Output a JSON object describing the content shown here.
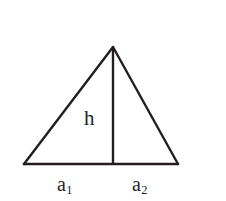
{
  "figure": {
    "kind": "geometry-diagram",
    "shape": "triangle",
    "background_color": "#ffffff",
    "stroke_color": "#231f1f",
    "labels": {
      "height": "h",
      "base_left": "a",
      "base_left_subscript": "1",
      "base_right": "a",
      "base_right_subscript": "2"
    },
    "geometry": {
      "apex": [
        113,
        47
      ],
      "left_vertex": [
        24,
        164
      ],
      "right_vertex": [
        178,
        164
      ],
      "foot_of_height": [
        113,
        164
      ],
      "base_stroke_width": 2.6,
      "side_stroke_width": 2.4,
      "height_stroke_width": 2.4
    }
  }
}
